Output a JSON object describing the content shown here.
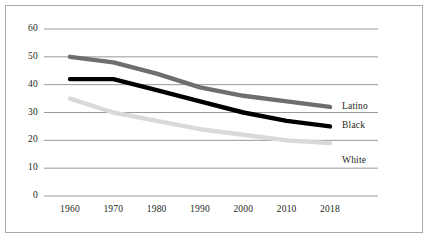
{
  "chart_data": {
    "type": "line",
    "title": "",
    "subtitle": "",
    "xlabel": "",
    "ylabel": "",
    "x": [
      "1960",
      "1970",
      "1980",
      "1990",
      "2000",
      "2010",
      "2018"
    ],
    "categories": [
      "1960",
      "1970",
      "1980",
      "1990",
      "2000",
      "2010",
      "2018"
    ],
    "xtick_labels": [
      "1960",
      "1970",
      "1980",
      "1990",
      "2000",
      "2010",
      "2018"
    ],
    "ytick_labels": [
      "0",
      "10",
      "20",
      "30",
      "40",
      "50",
      "60"
    ],
    "ylim": [
      0,
      60
    ],
    "ytick_step": 10,
    "grid": "horizontal",
    "legend_position": "inline-right-end-labels",
    "series": [
      {
        "name": "Latino",
        "color": "#6d6e70",
        "values": [
          50,
          48,
          44,
          39,
          36,
          34,
          32
        ],
        "end_label": "Latino"
      },
      {
        "name": "Black",
        "color": "#000000",
        "values": [
          42,
          42,
          38,
          34,
          30,
          27,
          25
        ],
        "end_label": "Black"
      },
      {
        "name": "White",
        "color": "#d9d9d9",
        "values": [
          35,
          30,
          27,
          24,
          22,
          20,
          19
        ],
        "end_label": "White"
      }
    ],
    "annotations": [
      {
        "text": "Latino",
        "series": "Latino"
      },
      {
        "text": "Black",
        "series": "Black"
      },
      {
        "text": "White",
        "series": "White"
      }
    ]
  },
  "style": {
    "border_color": "#a9a9a9",
    "gridline_color": "#8c8c8c",
    "background": "#ffffff",
    "text_color": "#231f20"
  }
}
